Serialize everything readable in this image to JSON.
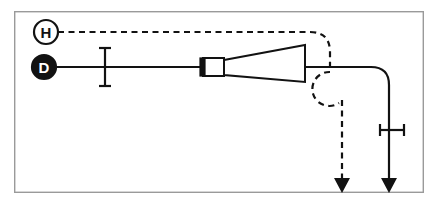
{
  "canvas": {
    "width": 436,
    "height": 210,
    "background_color": "#ffffff"
  },
  "frame": {
    "name": "diagram-border",
    "x": 14,
    "y": 11,
    "width": 410,
    "height": 182,
    "stroke_color": "#9a9a9a",
    "fill_color": "#ffffff"
  },
  "style": {
    "line_color": "#121212",
    "line_width": 2.2,
    "dash_pattern": "6 4.5"
  },
  "nodes": [
    {
      "id": "node-h",
      "label": "H",
      "kind": "open-circle",
      "cx": 46,
      "cy": 32,
      "r": 12,
      "fill_color": "#ffffff",
      "stroke_color": "#121212",
      "label_color": "#121212"
    },
    {
      "id": "node-d",
      "label": "D",
      "kind": "filled-circle",
      "cx": 44,
      "cy": 67,
      "r": 12,
      "fill_color": "#121212",
      "stroke_color": "#121212",
      "label_color": "#ffffff"
    }
  ],
  "paths": [
    {
      "id": "path-h-dashed",
      "style": "dashed",
      "from_node": "node-h",
      "to": "arrow-dashed",
      "d": "M 58 32 L 310 32 Q 330 32 330 52 L 330 72"
    },
    {
      "id": "path-dashed-loop",
      "style": "dashed",
      "d": "M 330 72 A 17 17 0 1 0 339 103 L 342 182"
    },
    {
      "id": "path-d-solid",
      "style": "solid",
      "from_node": "node-d",
      "to": "arrow-solid",
      "d": "M 56 67 L 371 67 Q 389 67 389 85 L 389 184"
    }
  ],
  "arrows": [
    {
      "id": "arrow-dashed",
      "style": "dashed",
      "tip_x": 342,
      "tip_y": 193,
      "direction": "down"
    },
    {
      "id": "arrow-solid",
      "style": "solid",
      "tip_x": 389,
      "tip_y": 193,
      "direction": "down"
    }
  ],
  "markers": [
    {
      "id": "marker-left-vertical",
      "kind": "i-beam-vertical",
      "x": 105,
      "y_top": 48,
      "y_bottom": 86,
      "cap_half_width": 6
    },
    {
      "id": "marker-right-horizontal",
      "kind": "i-beam-horizontal",
      "y": 130,
      "x_left": 380,
      "x_right": 404,
      "cap_half_height": 6
    }
  ],
  "shapes": [
    {
      "id": "shape-inlet-block",
      "kind": "rectangle",
      "x": 203,
      "y": 58,
      "width": 21,
      "height": 18,
      "fill_color": "#ffffff",
      "stroke_color": "#121212"
    },
    {
      "id": "shape-inlet-plug",
      "kind": "filled-rectangle",
      "x": 200,
      "y": 58,
      "width": 5,
      "height": 18,
      "fill_color": "#121212"
    },
    {
      "id": "shape-cone",
      "kind": "trapezoid",
      "points": "224,60 305,45 305,82 224,75",
      "fill_color": "#ffffff",
      "stroke_color": "#121212"
    }
  ]
}
